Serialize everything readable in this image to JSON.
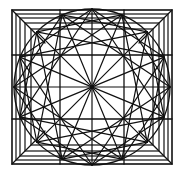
{
  "diagram": {
    "type": "geometric-star-pattern",
    "stroke_color": "#111111",
    "background": "#ffffff",
    "center": [
      92,
      87
    ],
    "circle_radius": 78,
    "outer_square": [
      12,
      10,
      172,
      164
    ],
    "nested_square_insets": [
      0,
      4,
      8,
      13,
      19
    ],
    "circle_points": 16,
    "star_skips": [
      3,
      5
    ],
    "grid_x": [
      60,
      124
    ],
    "grid_y": [
      55,
      119
    ]
  }
}
